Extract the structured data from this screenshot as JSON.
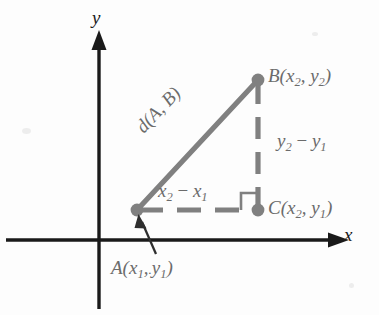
{
  "figure": {
    "background_color": "#fdfdfd",
    "axis_color": "#1a1a1a",
    "triangle_color": "#808080",
    "label_color": "#6b6b6b",
    "pointer_color": "#2e2e2e"
  },
  "axes": {
    "x_label": "x",
    "y_label": "y",
    "origin": {
      "x": 99,
      "y": 240
    }
  },
  "points": [
    {
      "id": "A",
      "label": "A",
      "sub_x": "1",
      "sub_y": "1",
      "label_full": "A(x1, y1)",
      "x": 137,
      "y": 210
    },
    {
      "id": "B",
      "label": "B",
      "sub_x": "2",
      "sub_y": "2",
      "label_full": "B(x2, y2)",
      "x": 258,
      "y": 80
    },
    {
      "id": "C",
      "label": "C",
      "sub_x": "2",
      "sub_y": "1",
      "label_full": "C(x2, y1)",
      "x": 258,
      "y": 210
    }
  ],
  "labels": {
    "point_a": {
      "name": "A",
      "open": "(",
      "var1": "x",
      "sub1": "1",
      "comma": ",",
      "artifact": ".",
      "var2": "y",
      "sub2": "1",
      "close": ")"
    },
    "point_b": {
      "name": "B",
      "open": "(",
      "var1": "x",
      "sub1": "2",
      "comma": ", ",
      "var2": "y",
      "sub2": "2",
      "close": ")"
    },
    "point_c": {
      "name": "C",
      "open": "(",
      "var1": "x",
      "sub1": "2",
      "comma": ", ",
      "var2": "y",
      "sub2": "1",
      "close": ")"
    },
    "hypotenuse": {
      "name": "d",
      "open": "(",
      "arg1": "A",
      "comma": ", ",
      "arg2": "B",
      "close": ")",
      "text": "d(A, B)"
    },
    "leg_horizontal": {
      "var1": "x",
      "sub1": "2",
      "operator": " − ",
      "var2": "x",
      "sub2": "1",
      "text": "x2 − x1"
    },
    "leg_vertical": {
      "var1": "y",
      "sub1": "2",
      "operator": " − ",
      "var2": "y",
      "sub2": "1",
      "text": "y2 − y1"
    }
  },
  "segments": [
    {
      "name": "hypotenuse",
      "from": "A",
      "to": "B",
      "style": "solid",
      "color": "#808080"
    },
    {
      "name": "vertical-leg",
      "from": "B",
      "to": "C",
      "style": "dashed",
      "color": "#808080"
    },
    {
      "name": "horizontal-leg",
      "from": "A",
      "to": "C",
      "style": "dashed",
      "color": "#808080"
    }
  ],
  "markers": {
    "right_angle_at": "C",
    "pointer_to": "A"
  }
}
